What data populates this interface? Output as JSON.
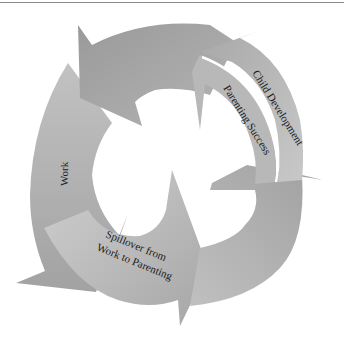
{
  "diagram": {
    "type": "cycle",
    "segments": [
      {
        "id": "top",
        "label": ""
      },
      {
        "id": "child-development",
        "label": "Child Development"
      },
      {
        "id": "parenting-success",
        "label": "Parenting Success"
      },
      {
        "id": "lower-right",
        "label": ""
      },
      {
        "id": "spillover",
        "label_line1": "Spillover from",
        "label_line2": "Work to Parenting"
      },
      {
        "id": "work",
        "label": "Work"
      }
    ],
    "colors": {
      "dark": "#9c9c9c",
      "mid": "#b0b0b0",
      "light": "#c4c4c4"
    }
  }
}
